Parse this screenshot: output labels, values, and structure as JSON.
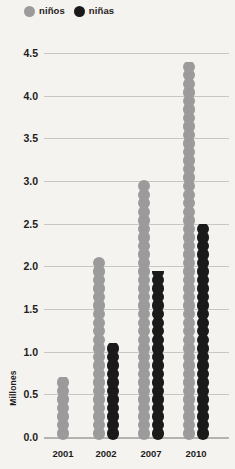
{
  "legend": {
    "items": [
      {
        "label": "niños",
        "color": "#9b9b9b",
        "key": "ninos"
      },
      {
        "label": "niñas",
        "color": "#1a1a1a",
        "key": "ninas"
      }
    ]
  },
  "axis": {
    "y_title": "Millones",
    "y_ticks": [
      "0.0",
      "0.5",
      "1.0",
      "1.5",
      "2.0",
      "2.5",
      "3.0",
      "3.5",
      "4.0",
      "4.5"
    ],
    "x_ticks": [
      "2001",
      "2002",
      "2007",
      "2010"
    ]
  },
  "colors": {
    "background": "#f5f3ef",
    "gridline": "#c9c7c3",
    "baseline": "#b4b2ae",
    "text": "#1d1d1d",
    "ninos": "#9b9b9b",
    "ninas": "#1a1a1a"
  },
  "chart_data": {
    "type": "bar",
    "title": "",
    "subtitle": "",
    "xlabel": "",
    "ylabel": "Millones",
    "categories": [
      "2001",
      "2002",
      "2007",
      "2010"
    ],
    "series": [
      {
        "name": "niños",
        "color": "#9b9b9b",
        "values": [
          0.7,
          2.15,
          3.05,
          4.4
        ]
      },
      {
        "name": "niñas",
        "color": "#1a1a1a",
        "values": [
          null,
          1.1,
          1.95,
          2.5
        ]
      }
    ],
    "ylim": [
      0.0,
      4.5
    ],
    "ytick_step": 0.5,
    "grid": true,
    "legend_position": "top-left"
  }
}
